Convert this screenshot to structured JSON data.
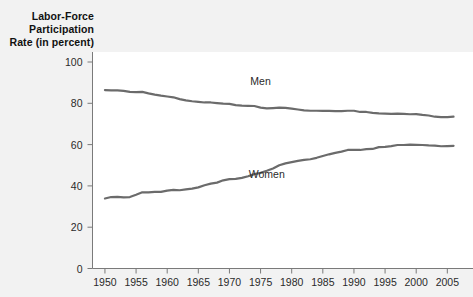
{
  "chart_data": {
    "type": "line",
    "title": "",
    "ylabel": "Labor-Force Participation Rate (in percent)",
    "ylabel_lines": [
      "Labor-Force",
      "Participation",
      "Rate (in percent)"
    ],
    "xlabel": "",
    "xlim": [
      1948,
      2008
    ],
    "ylim": [
      0,
      100
    ],
    "yticks": [
      0,
      20,
      40,
      60,
      80,
      100
    ],
    "ytick_labels": [
      "0",
      "20",
      "40",
      "60",
      "80",
      "100"
    ],
    "xticks": [
      1950,
      1955,
      1960,
      1965,
      1970,
      1975,
      1980,
      1985,
      1990,
      1995,
      2000,
      2005
    ],
    "xtick_labels": [
      "1950",
      "1955",
      "1960",
      "1965",
      "1970",
      "1975",
      "1980",
      "1985",
      "1990",
      "1995",
      "2000",
      "2005"
    ],
    "grid": false,
    "legend": "inline-annotations",
    "line_color": "#6b6b6b",
    "axis_color": "#7a7a7a",
    "plot_background": "#ffffff",
    "page_background": "#f2f2f2",
    "x": [
      1950,
      1951,
      1952,
      1953,
      1954,
      1955,
      1956,
      1957,
      1958,
      1959,
      1960,
      1961,
      1962,
      1963,
      1964,
      1965,
      1966,
      1967,
      1968,
      1969,
      1970,
      1971,
      1972,
      1973,
      1974,
      1975,
      1976,
      1977,
      1978,
      1979,
      1980,
      1981,
      1982,
      1983,
      1984,
      1985,
      1986,
      1987,
      1988,
      1989,
      1990,
      1991,
      1992,
      1993,
      1994,
      1995,
      1996,
      1997,
      1998,
      1999,
      2000,
      2001,
      2002,
      2003,
      2004,
      2005,
      2006
    ],
    "series": [
      {
        "name": "Men",
        "label": "Men",
        "label_x": 1975,
        "label_y": 89,
        "values": [
          86.4,
          86.3,
          86.3,
          86.0,
          85.5,
          85.4,
          85.5,
          84.8,
          84.2,
          83.7,
          83.3,
          82.9,
          82.0,
          81.4,
          81.0,
          80.7,
          80.4,
          80.4,
          80.1,
          79.8,
          79.7,
          79.1,
          78.9,
          78.8,
          78.7,
          77.9,
          77.5,
          77.7,
          77.9,
          77.8,
          77.4,
          77.0,
          76.6,
          76.4,
          76.4,
          76.3,
          76.3,
          76.2,
          76.2,
          76.4,
          76.4,
          75.8,
          75.8,
          75.4,
          75.1,
          75.0,
          74.9,
          75.0,
          74.9,
          74.7,
          74.8,
          74.4,
          74.1,
          73.5,
          73.3,
          73.3,
          73.5
        ]
      },
      {
        "name": "Women",
        "label": "Women",
        "label_x": 1976,
        "label_y": 44,
        "values": [
          33.9,
          34.6,
          34.7,
          34.4,
          34.6,
          35.7,
          36.9,
          36.9,
          37.1,
          37.1,
          37.7,
          38.1,
          37.9,
          38.3,
          38.7,
          39.3,
          40.3,
          41.1,
          41.6,
          42.7,
          43.3,
          43.4,
          43.9,
          44.7,
          45.7,
          46.3,
          47.3,
          48.4,
          50.0,
          50.9,
          51.5,
          52.1,
          52.6,
          52.9,
          53.6,
          54.5,
          55.3,
          56.0,
          56.6,
          57.4,
          57.5,
          57.4,
          57.8,
          57.9,
          58.8,
          58.9,
          59.3,
          59.8,
          59.8,
          60.0,
          59.9,
          59.8,
          59.6,
          59.5,
          59.2,
          59.3,
          59.4
        ]
      }
    ]
  }
}
